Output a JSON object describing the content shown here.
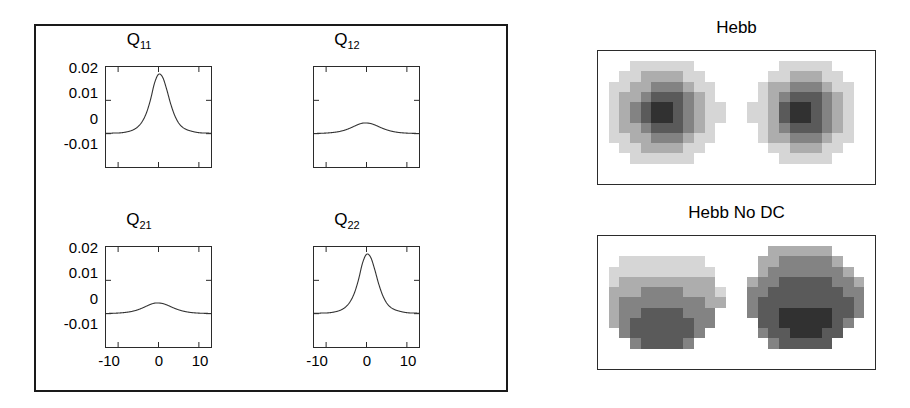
{
  "figure": {
    "left_panel": {
      "subplots": [
        {
          "name": "Q11",
          "title_main": "Q",
          "title_sub": "11",
          "peak": 0.0178,
          "width": 3.3,
          "baseline": 0.0
        },
        {
          "name": "Q12",
          "title_main": "Q",
          "title_sub": "12",
          "peak": 0.0032,
          "width": 4.0,
          "baseline": 0.0
        },
        {
          "name": "Q21",
          "title_main": "Q",
          "title_sub": "21",
          "peak": 0.0032,
          "width": 4.0,
          "baseline": 0.0
        },
        {
          "name": "Q22",
          "title_main": "Q",
          "title_sub": "22",
          "peak": 0.0178,
          "width": 3.3,
          "baseline": 0.0
        }
      ],
      "yticks": [
        "0.02",
        "0.01",
        "0",
        "-0.01"
      ],
      "xticks": [
        "-10",
        "0",
        "10"
      ]
    },
    "right_panels": [
      {
        "name": "hebb",
        "title": "Hebb"
      },
      {
        "name": "hebb-no-dc",
        "title": "Hebb No DC"
      }
    ]
  },
  "chart_data": [
    {
      "type": "line",
      "title": "Q11",
      "xlabel": "",
      "ylabel": "",
      "xlim": [
        -13,
        13
      ],
      "ylim": [
        -0.01,
        0.02
      ],
      "xticks": [
        -10,
        0,
        10
      ],
      "yticks": [
        -0.01,
        0,
        0.01,
        0.02
      ],
      "grid": false,
      "legend": "none",
      "series": [
        {
          "name": "Q11",
          "description": "Symmetric bell-shaped correlation function peaking at x=0",
          "x": [
            -13,
            -12,
            -11,
            -10,
            -9,
            -8,
            -7,
            -6,
            -5,
            -4,
            -3,
            -2,
            -1,
            0,
            1,
            2,
            3,
            4,
            5,
            6,
            7,
            8,
            9,
            10,
            11,
            12,
            13
          ],
          "y": [
            0.0001,
            0.0001,
            0.0002,
            0.0002,
            0.0003,
            0.0005,
            0.0008,
            0.0013,
            0.0022,
            0.0037,
            0.0062,
            0.0101,
            0.0151,
            0.0178,
            0.017,
            0.0134,
            0.009,
            0.0055,
            0.0032,
            0.0019,
            0.0012,
            0.0008,
            0.0005,
            0.0003,
            0.0002,
            0.0002,
            0.0001
          ]
        }
      ]
    },
    {
      "type": "line",
      "title": "Q12",
      "xlabel": "",
      "ylabel": "",
      "xlim": [
        -13,
        13
      ],
      "ylim": [
        -0.01,
        0.02
      ],
      "xticks": [
        -10,
        0,
        10
      ],
      "yticks": [
        -0.01,
        0,
        0.01,
        0.02
      ],
      "grid": false,
      "legend": "none",
      "series": [
        {
          "name": "Q12",
          "description": "Low-amplitude broad bump peaking near x=0",
          "x": [
            -13,
            -12,
            -11,
            -10,
            -9,
            -8,
            -7,
            -6,
            -5,
            -4,
            -3,
            -2,
            -1,
            0,
            1,
            2,
            3,
            4,
            5,
            6,
            7,
            8,
            9,
            10,
            11,
            12,
            13
          ],
          "y": [
            5e-05,
            8e-05,
            0.00012,
            0.00018,
            0.00027,
            0.0004,
            0.00058,
            0.00085,
            0.00122,
            0.0017,
            0.00225,
            0.00278,
            0.00315,
            0.0032,
            0.00305,
            0.00265,
            0.00212,
            0.0016,
            0.00115,
            0.0008,
            0.00054,
            0.00036,
            0.00024,
            0.00016,
            0.00011,
            8e-05,
            5e-05
          ]
        }
      ]
    },
    {
      "type": "line",
      "title": "Q21",
      "xlabel": "",
      "ylabel": "",
      "xlim": [
        -13,
        13
      ],
      "ylim": [
        -0.01,
        0.02
      ],
      "xticks": [
        -10,
        0,
        10
      ],
      "yticks": [
        -0.01,
        0,
        0.01,
        0.02
      ],
      "grid": false,
      "legend": "none",
      "series": [
        {
          "name": "Q21",
          "description": "Low-amplitude broad bump peaking near x=0",
          "x": [
            -13,
            -12,
            -11,
            -10,
            -9,
            -8,
            -7,
            -6,
            -5,
            -4,
            -3,
            -2,
            -1,
            0,
            1,
            2,
            3,
            4,
            5,
            6,
            7,
            8,
            9,
            10,
            11,
            12,
            13
          ],
          "y": [
            5e-05,
            8e-05,
            0.00012,
            0.00018,
            0.00027,
            0.0004,
            0.00058,
            0.00085,
            0.00122,
            0.0017,
            0.00225,
            0.00278,
            0.00315,
            0.0032,
            0.00305,
            0.00265,
            0.00212,
            0.0016,
            0.00115,
            0.0008,
            0.00054,
            0.00036,
            0.00024,
            0.00016,
            0.00011,
            8e-05,
            5e-05
          ]
        }
      ]
    },
    {
      "type": "line",
      "title": "Q22",
      "xlabel": "",
      "ylabel": "",
      "xlim": [
        -13,
        13
      ],
      "ylim": [
        -0.01,
        0.02
      ],
      "xticks": [
        -10,
        0,
        10
      ],
      "yticks": [
        -0.01,
        0,
        0.01,
        0.02
      ],
      "grid": false,
      "legend": "none",
      "series": [
        {
          "name": "Q22",
          "description": "Symmetric bell-shaped correlation function peaking at x=0",
          "x": [
            -13,
            -12,
            -11,
            -10,
            -9,
            -8,
            -7,
            -6,
            -5,
            -4,
            -3,
            -2,
            -1,
            0,
            1,
            2,
            3,
            4,
            5,
            6,
            7,
            8,
            9,
            10,
            11,
            12,
            13
          ],
          "y": [
            0.0001,
            0.0001,
            0.0002,
            0.0002,
            0.0003,
            0.0005,
            0.0008,
            0.0013,
            0.0022,
            0.0037,
            0.0062,
            0.0101,
            0.0151,
            0.0178,
            0.017,
            0.0134,
            0.009,
            0.0055,
            0.0032,
            0.0019,
            0.0012,
            0.0008,
            0.0005,
            0.0003,
            0.0002,
            0.0002,
            0.0001
          ]
        }
      ]
    },
    {
      "type": "heatmap",
      "title": "Hebb",
      "description": "Two side-by-side receptive-field maps; each is a radially symmetric blob with darkest center, grayscale on a white background",
      "grid_cols": 26,
      "grid_rows": 13,
      "colormap": "gray (dark = high)",
      "blobs": [
        {
          "center_col": 6.2,
          "center_row": 6.0,
          "radius": 5.4,
          "profile": "radial",
          "min_level": 0.08,
          "max_level": 1.0
        },
        {
          "center_col": 19.4,
          "center_row": 6.0,
          "radius": 5.4,
          "profile": "radial",
          "min_level": 0.05,
          "max_level": 1.0
        }
      ]
    },
    {
      "type": "heatmap",
      "title": "Hebb No DC",
      "description": "Two side-by-side receptive-field maps; each blob has a vertical light-to-dark gradient, brightest at the top and darkest at the bottom",
      "grid_cols": 26,
      "grid_rows": 13,
      "colormap": "gray (dark = high)",
      "blobs": [
        {
          "center_col": 6.2,
          "center_row": 6.0,
          "radius": 5.4,
          "profile": "vertical-gradient",
          "top_level": 1.0,
          "bottom_level": 0.05
        },
        {
          "center_col": 19.4,
          "center_row": 6.0,
          "radius": 5.4,
          "profile": "vertical-gradient",
          "top_level": 0.58,
          "bottom_level": 0.0
        }
      ]
    }
  ]
}
